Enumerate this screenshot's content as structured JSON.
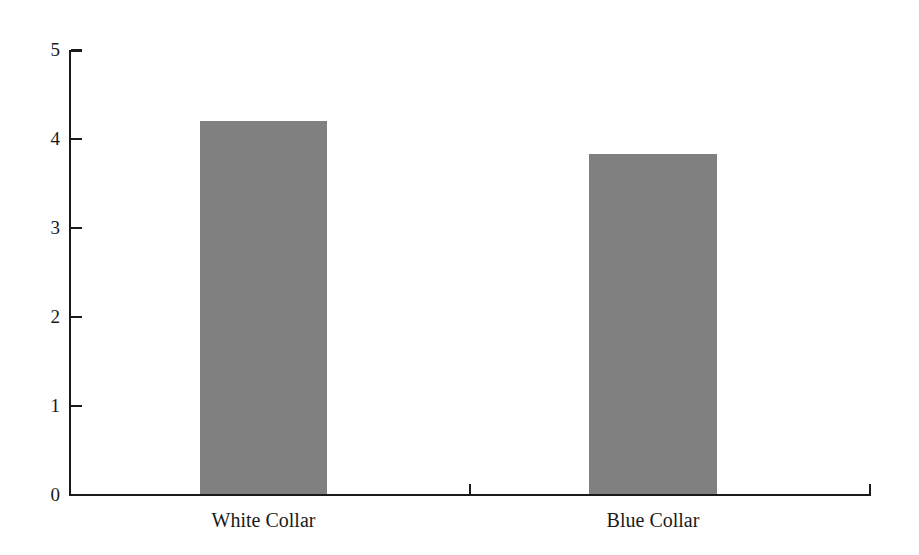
{
  "chart_data": {
    "type": "bar",
    "title": "",
    "subtitle": "",
    "xlabel": "",
    "ylabel": "",
    "categories": [
      "White Collar",
      "Blue Collar"
    ],
    "values": [
      4.2,
      3.83
    ],
    "ylim": [
      0,
      5
    ],
    "yticks": [
      0,
      1,
      2,
      3,
      4,
      5
    ],
    "ytick_labels": [
      "0",
      "1",
      "2",
      "3",
      "4",
      "5"
    ],
    "grid": false,
    "legend": false,
    "legend_position": "none",
    "annotations": [],
    "series": [
      {
        "name": "",
        "values": [
          4.2,
          3.83
        ]
      }
    ]
  },
  "style": {
    "bar_color": "#808080",
    "axis_color": "#1a1a1a",
    "background": "#ffffff"
  },
  "axes": {
    "y_tick_labels": [
      "5",
      "4",
      "3",
      "2",
      "1",
      "0"
    ]
  }
}
